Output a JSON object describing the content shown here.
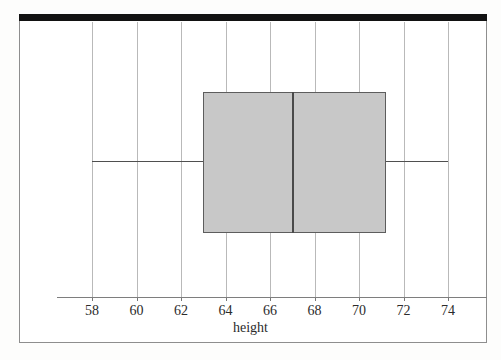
{
  "figure": {
    "background_color": "#fdfdfc",
    "frame_color": "#8e8e8e",
    "top_bar_color": "#121212",
    "scan_band_color": "#efefed"
  },
  "chart_data": {
    "type": "box",
    "orientation": "horizontal",
    "title": "",
    "xlabel": "height",
    "ylabel": "",
    "xlim": [
      56.5,
      75.5
    ],
    "grid": true,
    "legend": null,
    "xticks": [
      58,
      60,
      62,
      64,
      66,
      68,
      70,
      72,
      74
    ],
    "xticklabels": [
      "58",
      "60",
      "62",
      "64",
      "66",
      "68",
      "70",
      "72",
      "74"
    ],
    "boxes": [
      {
        "name": "height",
        "whisker_low": 58,
        "q1": 63,
        "median": 67,
        "q3": 71.2,
        "whisker_high": 74,
        "outliers": [],
        "fill_color": "#c8c8c8",
        "edge_color": "#5d5d5d",
        "median_color": "#4a4a4a",
        "whisker_color": "#4f4f4f"
      }
    ]
  },
  "geometry": {
    "plot_left_px": 57,
    "plot_right_px": 487,
    "grid_top_px": 22,
    "axis_y_px": 297,
    "box_top_px": 92,
    "box_bottom_px": 233,
    "whisker_y_px": 161,
    "px_per_unit": 22.25,
    "x_at_58_px": 92
  }
}
